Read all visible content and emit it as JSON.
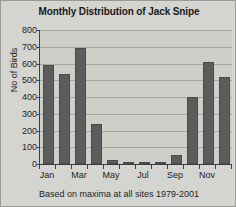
{
  "chart_data": {
    "type": "bar",
    "title": "Monthly Distribution of Jack Snipe",
    "xlabel": "",
    "ylabel": "No of Birds",
    "categories": [
      "Jan",
      "Feb",
      "Mar",
      "Apr",
      "May",
      "Jun",
      "Jul",
      "Aug",
      "Sep",
      "Oct",
      "Nov",
      "Dec"
    ],
    "values": [
      590,
      540,
      690,
      240,
      25,
      5,
      5,
      10,
      55,
      400,
      610,
      520
    ],
    "visible_tick_labels": [
      "Jan",
      "",
      "Mar",
      "",
      "May",
      "",
      "Jul",
      "",
      "Sep",
      "",
      "Nov",
      ""
    ],
    "ylim": [
      0,
      800
    ],
    "yticks": [
      800,
      700,
      600,
      500,
      400,
      300,
      200,
      100,
      0
    ],
    "ytick_labels": [
      "800",
      "700",
      "600",
      "500",
      "400",
      "300",
      "200",
      "100",
      "0"
    ],
    "grid": true,
    "legend": false,
    "caption": "Based on maxima at all sites 1979-2001",
    "colors": {
      "bar": "#5c5c5c",
      "bar_edge": "#4a4a4a",
      "plot_background": "#cfcfca",
      "figure_background": "#d4d4d0",
      "gridline": "#a8a8a3",
      "axis": "#3e3e3e",
      "text": "#1f1f1f",
      "border": "#9a9a96"
    }
  }
}
